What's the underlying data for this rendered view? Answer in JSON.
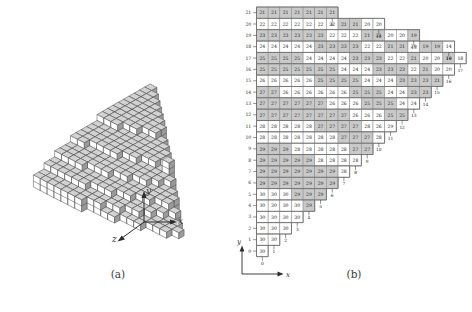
{
  "figure": {
    "panel_a": {
      "caption": "(a)",
      "axes": {
        "x": "x",
        "y": "y",
        "z": "z"
      },
      "description": "isometric stack of unit cubes forming a terraced height field"
    },
    "panel_b": {
      "caption": "(b)",
      "axes": {
        "x": "x",
        "y": "y"
      },
      "y_ticks": [
        21,
        20,
        19,
        18,
        17,
        16,
        15,
        14,
        13,
        12,
        11,
        10,
        9,
        8,
        7,
        6,
        5,
        4,
        3,
        2,
        1,
        0
      ],
      "x_ticks_diagonal": [
        0,
        1,
        2,
        3,
        4,
        5,
        6,
        7,
        8,
        9,
        10,
        11,
        12,
        13,
        14,
        15,
        16,
        17
      ],
      "colors": {
        "cell_stroke": "#8c8c8c",
        "cell_fill_plain": "#ffffff",
        "cell_fill_shaded": "#c9c9c9",
        "outline": "#6f6f6f",
        "text": "#1a1a1a"
      },
      "note": "rows indexed by y from 21 (top) down to 0 (bottom); each row lists the height value in every occupied cell, and 'shaded' flags which of those cells are filled gray",
      "rows": [
        {
          "y": 21,
          "values": [
            21,
            21,
            21,
            21,
            21,
            21,
            21
          ],
          "shaded": [
            1,
            1,
            1,
            1,
            1,
            1,
            1
          ]
        },
        {
          "y": 20,
          "values": [
            22,
            22,
            22,
            22,
            22,
            22,
            22,
            21,
            21,
            20,
            20
          ],
          "shaded": [
            0,
            0,
            0,
            0,
            0,
            0,
            0,
            1,
            1,
            0,
            0
          ]
        },
        {
          "y": 19,
          "values": [
            23,
            23,
            23,
            23,
            23,
            23,
            22,
            22,
            22,
            21,
            21,
            20,
            20,
            19
          ],
          "shaded": [
            1,
            1,
            1,
            1,
            1,
            1,
            0,
            0,
            0,
            1,
            1,
            0,
            0,
            1
          ]
        },
        {
          "y": 18,
          "values": [
            24,
            24,
            24,
            24,
            24,
            23,
            23,
            23,
            23,
            22,
            22,
            21,
            21,
            20,
            19,
            19,
            14
          ],
          "shaded": [
            0,
            0,
            0,
            0,
            0,
            1,
            1,
            1,
            1,
            0,
            0,
            1,
            1,
            0,
            1,
            1,
            0
          ]
        },
        {
          "y": 17,
          "values": [
            25,
            25,
            25,
            25,
            24,
            24,
            24,
            24,
            23,
            23,
            23,
            22,
            22,
            21,
            20,
            20,
            19,
            18
          ],
          "shaded": [
            1,
            1,
            1,
            1,
            0,
            0,
            0,
            0,
            1,
            1,
            1,
            0,
            0,
            1,
            0,
            0,
            1,
            0
          ]
        },
        {
          "y": 16,
          "values": [
            25,
            25,
            25,
            25,
            25,
            25,
            25,
            24,
            24,
            24,
            23,
            23,
            23,
            22,
            21,
            20,
            20
          ],
          "shaded": [
            1,
            1,
            1,
            1,
            1,
            1,
            1,
            0,
            0,
            0,
            1,
            1,
            1,
            0,
            1,
            0,
            0
          ]
        },
        {
          "y": 15,
          "values": [
            26,
            26,
            26,
            26,
            26,
            25,
            25,
            25,
            25,
            24,
            24,
            24,
            23,
            23,
            23,
            21
          ],
          "shaded": [
            0,
            0,
            0,
            0,
            0,
            1,
            1,
            1,
            1,
            0,
            0,
            0,
            1,
            1,
            1,
            1
          ]
        },
        {
          "y": 14,
          "values": [
            27,
            27,
            26,
            26,
            26,
            26,
            26,
            26,
            25,
            25,
            25,
            24,
            24,
            23,
            23
          ],
          "shaded": [
            1,
            1,
            0,
            0,
            0,
            0,
            0,
            0,
            1,
            1,
            1,
            0,
            0,
            1,
            1
          ]
        },
        {
          "y": 13,
          "values": [
            27,
            27,
            27,
            27,
            27,
            27,
            26,
            26,
            26,
            25,
            25,
            25,
            24,
            24
          ],
          "shaded": [
            1,
            1,
            1,
            1,
            1,
            1,
            0,
            0,
            0,
            1,
            1,
            1,
            0,
            0
          ]
        },
        {
          "y": 12,
          "values": [
            27,
            27,
            27,
            27,
            27,
            27,
            27,
            27,
            26,
            26,
            26,
            25,
            25
          ],
          "shaded": [
            1,
            1,
            1,
            1,
            1,
            1,
            1,
            1,
            0,
            0,
            0,
            1,
            1
          ]
        },
        {
          "y": 11,
          "values": [
            28,
            28,
            28,
            28,
            28,
            27,
            27,
            27,
            27,
            28,
            26,
            29
          ],
          "shaded": [
            0,
            0,
            0,
            0,
            0,
            1,
            1,
            1,
            1,
            0,
            0,
            0
          ]
        },
        {
          "y": 10,
          "values": [
            28,
            28,
            28,
            28,
            28,
            28,
            28,
            27,
            27,
            27,
            28
          ],
          "shaded": [
            0,
            0,
            0,
            0,
            0,
            0,
            0,
            1,
            1,
            1,
            0
          ]
        },
        {
          "y": 9,
          "values": [
            29,
            29,
            29,
            28,
            28,
            28,
            28,
            28,
            27,
            27
          ],
          "shaded": [
            1,
            1,
            1,
            0,
            0,
            0,
            0,
            0,
            1,
            1
          ]
        },
        {
          "y": 8,
          "values": [
            29,
            29,
            29,
            29,
            29,
            28,
            28,
            28,
            28
          ],
          "shaded": [
            1,
            1,
            1,
            1,
            1,
            0,
            0,
            0,
            0
          ]
        },
        {
          "y": 7,
          "values": [
            29,
            29,
            29,
            29,
            29,
            29,
            29,
            28
          ],
          "shaded": [
            1,
            1,
            1,
            1,
            1,
            1,
            1,
            0
          ]
        },
        {
          "y": 6,
          "values": [
            29,
            29,
            29,
            29,
            29,
            29,
            29
          ],
          "shaded": [
            1,
            1,
            1,
            1,
            1,
            1,
            1
          ]
        },
        {
          "y": 5,
          "values": [
            30,
            30,
            30,
            29,
            29,
            29
          ],
          "shaded": [
            0,
            0,
            0,
            1,
            1,
            1
          ]
        },
        {
          "y": 4,
          "values": [
            30,
            30,
            30,
            30,
            29
          ],
          "shaded": [
            0,
            0,
            0,
            0,
            1
          ]
        },
        {
          "y": 3,
          "values": [
            30,
            30,
            30,
            30
          ],
          "shaded": [
            0,
            0,
            0,
            0
          ]
        },
        {
          "y": 2,
          "values": [
            30,
            30,
            30
          ],
          "shaded": [
            0,
            0,
            0
          ]
        },
        {
          "y": 1,
          "values": [
            30,
            30
          ],
          "shaded": [
            0,
            0
          ]
        },
        {
          "y": 0,
          "values": [
            30
          ],
          "shaded": [
            0
          ]
        }
      ]
    }
  }
}
